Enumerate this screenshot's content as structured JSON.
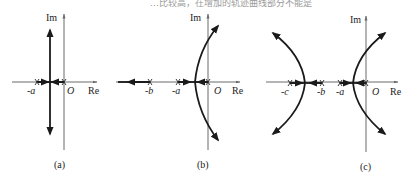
{
  "header_fragment": "…比较高，在增加的轨迹曲线部分不能是",
  "panels": [
    {
      "id": "a",
      "caption": "(a)",
      "axis_labels": {
        "real": "Re",
        "imag": "Im",
        "origin": "O"
      },
      "poles": [
        "-a",
        "0"
      ],
      "pole_labels": [
        "-a"
      ],
      "description": "Two poles at -a and 0; loci meet midway and break into vertical lines"
    },
    {
      "id": "b",
      "caption": "(b)",
      "axis_labels": {
        "real": "Re",
        "imag": "Im",
        "origin": "O"
      },
      "poles": [
        "-b",
        "-a",
        "0"
      ],
      "pole_labels": [
        "-b",
        "-a"
      ],
      "description": "Three poles; locus from -b goes left to -infinity, loci from -a and 0 break away and curve toward asymptotes"
    },
    {
      "id": "c",
      "caption": "(c)",
      "axis_labels": {
        "real": "Re",
        "imag": "Im",
        "origin": "O"
      },
      "poles": [
        "-c",
        "-b",
        "-a",
        "0"
      ],
      "pole_labels": [
        "-c",
        "-b",
        "-a"
      ],
      "description": "Four poles; two pairs of branches break away and curve outward"
    }
  ]
}
